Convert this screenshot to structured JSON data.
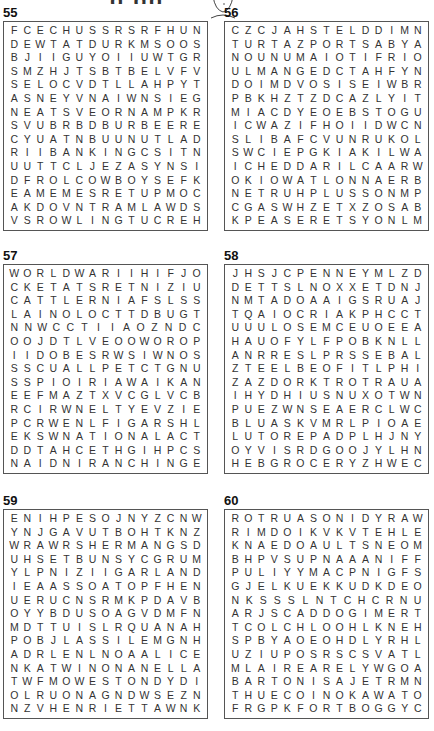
{
  "page": {
    "title_fragment": "g gg"
  },
  "puzzles": [
    {
      "number": "55",
      "rows": [
        "FCECHUSSRSRFHUN",
        "DEWTATDURKMSOOS",
        "BJIIGUYOIIUWTGR",
        "SMZHJTSBTBELVFV",
        "SELOCVDTLLAHPYT",
        "ASNEYVNAIWNSIEG",
        "NEATSVEORNAMPKR",
        "SVUBRBDBURBEERE",
        "CYUATNBUUNUTLAD",
        "RIIBANKINGCSITN",
        "UUTTCLJEZASYNSI",
        "DFROLCOWBOYSEFK",
        "EAMEMESRETUPMOC",
        "AKDOVNTRAMLAWDS",
        "VSROWLINGTUCREH"
      ]
    },
    {
      "number": "56",
      "rows": [
        "CZCJAHSTELDDIMN",
        "TURTAZPORTSABYA",
        "NOUNUMAIOTIFRIO",
        "ULMANGEDCTAHFYN",
        "DOIMDVOSISEIWBR",
        "PBKHZTZDCAZLYIT",
        "MIACDYEOEBSTOGU",
        "ICWAZIFHOIIDWCN",
        "SLIBAFCVUNRUKOL",
        "SWCIEPGKIAKILWA",
        "ICHEDDARILCAARW",
        "OKIOWATLONNAERB",
        "NETRUHPLUSSONMP",
        "CGASWHZETXZOSAB",
        "KPEASERETSYONLM"
      ]
    },
    {
      "number": "57",
      "rows": [
        "WORLDWARIIHIFJO",
        "CKETATSRETNIZIU",
        "CATTLERNIAFSLSS",
        "LAINOLOCTTDBUGT",
        "NNWCCTIIAOZNDC",
        "OOJDTLVEOOWOROP",
        "IIDOBESRWSIWNOS",
        "SSCUALLPETCTGNU",
        "SSPIOIRIAWAIKAN",
        "EEFMAZTXVCGLVCB",
        "RCIRWNELTYEVZIE",
        "PCRWENLFIGARSHL",
        "EKSWNATIONALACT",
        "DDTAHCETHGIHPCS",
        "NAIDNIRANCHINGE"
      ]
    },
    {
      "number": "58",
      "rows": [
        "JHSJCPENNEYMLZD",
        "DETTSLNOXXETDNJ",
        "NMTADOAAIGSRUAJ",
        "TQAIOCRIAKPHCCT",
        "UUULOSEMCEUOEEA",
        "HAUOFYLFPOBKNLL",
        "ANRRESLPRSSEBAL",
        "ZTEELBEOFITLPHI",
        "ZAZDORKTROTRAUA",
        "IHYDHIUSNUXOTWN",
        "PUEZWNSEAERCLWC",
        "BLUASKVMRLPIOAE",
        "LUTOREPADPLHJNY",
        "OYVISRDGOOJYLHN",
        "HEBGROCERYZHWEC"
      ]
    },
    {
      "number": "59",
      "rows": [
        "ENIHPESOJNYZCNW",
        "YNJGAVUTBOHTKNZ",
        "WRAWRSHERMANGSD",
        "UHSETBUNSYCGRUM",
        "YLPNIZIIGARLAND",
        "IEAASSOATOPFHEN",
        "UERUCNSRMKPDAVB",
        "OYYBDUSOAGVDMFN",
        "MDTTUISLRQUANAH",
        "POBJLASSILEMGNH",
        "ADRLENLNOAALICE",
        "NKATWINONANELLA",
        "TWFMOWESTONDYDI",
        "OLRUONAGNDWSEZN",
        "NZVHENRIETTAWNK"
      ]
    },
    {
      "number": "60",
      "rows": [
        "ROTRUASONIDYRAW",
        "RIMDOIKVKVTEHLE",
        "KNAEDOAULTSNEOM",
        "BHPVSUPNAAANIFF",
        "PULIYYMACPNIGFS",
        "GJELKUEKKUDKDEO",
        "NKSSSLNTCHCRNU",
        "ARJSCADDOGIMERT",
        "TCOLCHLOOHLKNEH",
        "SPBYAOEOHDLYRHL",
        "UZIUPOSRSCSVATL",
        "MLAIREARELYWGOA",
        "BARTONISAJETRMN",
        "THUECOINOKAWATO",
        "FRGPKFORTBOGGYC"
      ]
    }
  ]
}
